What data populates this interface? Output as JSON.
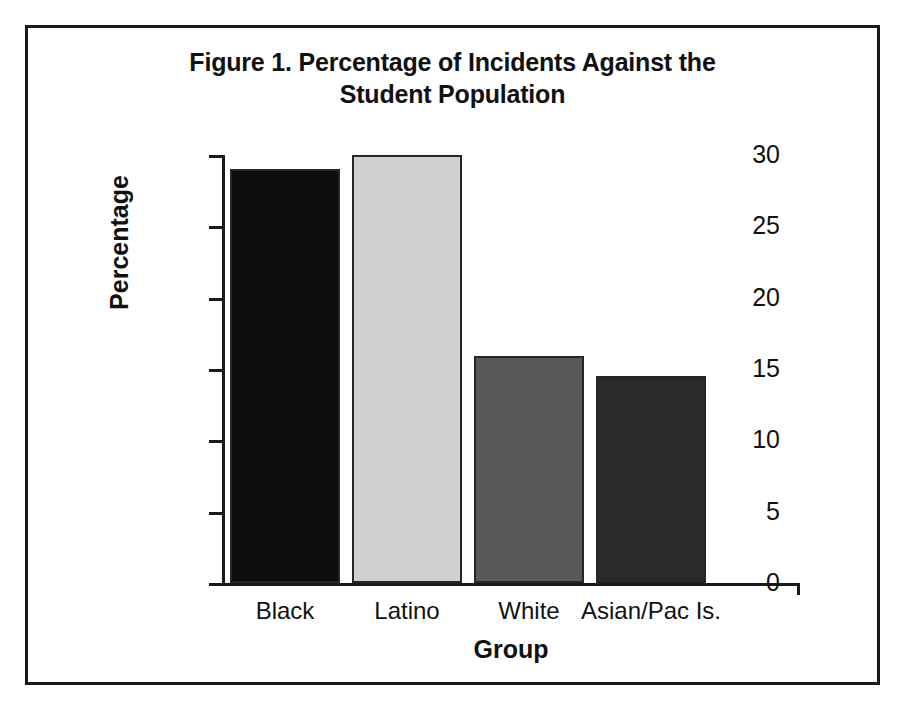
{
  "figure": {
    "title_line_1": "Figure 1. Percentage of Incidents Against the",
    "title_line_2": "Student Population",
    "frame_color": "#1a1a1a",
    "background_color": "#ffffff"
  },
  "chart_data": {
    "type": "bar",
    "title": "Figure 1. Percentage of Incidents Against the Student Population",
    "xlabel": "Group",
    "ylabel": "Percentage",
    "categories": [
      "Black",
      "Latino",
      "White",
      "Asian/Pac Is."
    ],
    "values": [
      29.0,
      30.0,
      15.9,
      14.5
    ],
    "bar_colors": [
      "#0d0d0d",
      "#d0d0d0",
      "#585858",
      "#2a2a2a"
    ],
    "bar_edge_color": "#262626",
    "ylim": [
      0,
      30
    ],
    "ytick_values": [
      0,
      5,
      10,
      15,
      20,
      25,
      30
    ],
    "ytick_labels": [
      "0",
      "5",
      "10",
      "15",
      "20",
      "25",
      "30"
    ],
    "grid": false,
    "legend": false,
    "legend_position": "none",
    "series": [
      {
        "name": "Percentage of Incidents",
        "values": [
          29.0,
          30.0,
          15.9,
          14.5
        ]
      }
    ]
  }
}
